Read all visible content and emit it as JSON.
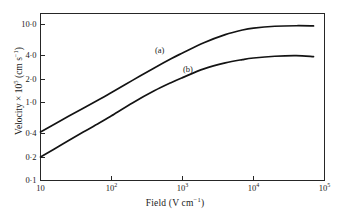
{
  "chart_data": {
    "type": "line",
    "title": "",
    "xlabel": "Field (V cm⁻¹)",
    "ylabel": "Velocity × 10⁵ (cm s⁻¹)",
    "xlabel_parts": {
      "text": "Field (V cm",
      "sup": "−1",
      "tail": ")"
    },
    "ylabel_parts": {
      "head": "Velocity × 10",
      "sup": "5",
      "tail": " (cm s",
      "sup2": "−1",
      "tail2": ")"
    },
    "xscale": "log",
    "yscale": "log",
    "xlim": [
      10,
      100000
    ],
    "ylim": [
      0.1,
      14
    ],
    "grid": false,
    "legend": "inline-curve-labels",
    "xticks": [
      {
        "value": 10,
        "label": "10",
        "mantissa": "10",
        "exponent": ""
      },
      {
        "value": 100,
        "label": "10²",
        "mantissa": "10",
        "exponent": "2"
      },
      {
        "value": 1000,
        "label": "10³",
        "mantissa": "10",
        "exponent": "3"
      },
      {
        "value": 10000,
        "label": "10⁴",
        "mantissa": "10",
        "exponent": "4"
      },
      {
        "value": 100000,
        "label": "10⁵",
        "mantissa": "10",
        "exponent": "5"
      }
    ],
    "yticks": [
      {
        "value": 10.0,
        "label": "10·0"
      },
      {
        "value": 4.0,
        "label": "4·0"
      },
      {
        "value": 2.0,
        "label": "2·0"
      },
      {
        "value": 1.0,
        "label": "1·0"
      },
      {
        "value": 0.4,
        "label": "0·4"
      },
      {
        "value": 0.2,
        "label": "0·2"
      },
      {
        "value": 0.1,
        "label": "0·1"
      }
    ],
    "series": [
      {
        "name": "(a)",
        "label": "(a)",
        "color": "#131313",
        "x": [
          10,
          20,
          40,
          70,
          100,
          200,
          400,
          700,
          1000,
          2000,
          4000,
          7000,
          10000,
          20000,
          40000,
          70000
        ],
        "y": [
          0.42,
          0.6,
          0.85,
          1.12,
          1.35,
          1.95,
          2.8,
          3.7,
          4.35,
          5.9,
          7.5,
          8.6,
          9.1,
          9.6,
          9.75,
          9.7
        ]
      },
      {
        "name": "(b)",
        "label": "(b)",
        "color": "#131313",
        "x": [
          10,
          20,
          40,
          70,
          100,
          200,
          400,
          700,
          1000,
          2000,
          4000,
          7000,
          10000,
          20000,
          40000,
          70000
        ],
        "y": [
          0.2,
          0.29,
          0.42,
          0.56,
          0.68,
          1.0,
          1.42,
          1.82,
          2.1,
          2.72,
          3.25,
          3.58,
          3.75,
          3.95,
          4.02,
          3.9
        ]
      }
    ],
    "annotations": [
      {
        "text": "(a)",
        "x_px": 155,
        "y_px": 45
      },
      {
        "text": "(b)",
        "x_px": 183,
        "y_px": 64
      }
    ]
  }
}
